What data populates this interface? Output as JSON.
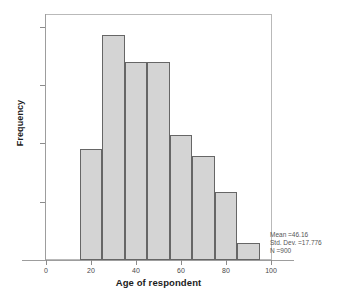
{
  "top_caption": "",
  "chart_data": {
    "type": "bar",
    "title": "",
    "subtitle": "",
    "xlabel": "Age of respondent",
    "ylabel": "Frequency",
    "xlim": [
      0,
      100
    ],
    "ylim": [
      0,
      210
    ],
    "grid": false,
    "legend": "none",
    "bin_width": 10,
    "categories": [
      "15-25",
      "25-35",
      "35-45",
      "45-55",
      "55-65",
      "65-75",
      "75-85",
      "85-95"
    ],
    "bin_edges": [
      15,
      25,
      35,
      45,
      55,
      65,
      75,
      85,
      95
    ],
    "values": [
      95,
      193,
      170,
      170,
      107,
      89,
      58,
      15
    ],
    "x_ticks": [
      "0",
      "20",
      "40",
      "60",
      "80",
      "100"
    ],
    "x_tick_values": [
      0,
      20,
      40,
      60,
      80,
      100
    ],
    "y_ticks": [
      "0",
      "50",
      "100",
      "150",
      "200"
    ],
    "y_tick_values": [
      0,
      50,
      100,
      150,
      200
    ],
    "bar_fill_color": "#d4d4d4",
    "bar_border_color": "#666666",
    "axis_color": "#9d9d9d",
    "background_color": "#ffffff"
  },
  "statistics": {
    "mean_label": "Mean =46.16",
    "std_dev_label": "Std. Dev. =17.776",
    "n_label": "N =900"
  }
}
